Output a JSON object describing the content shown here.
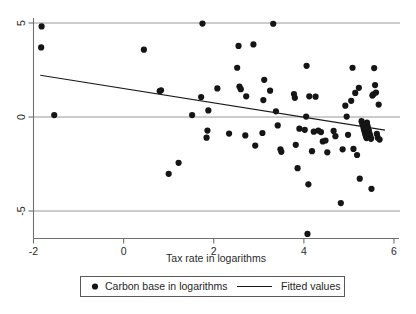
{
  "chart_data": {
    "type": "scatter",
    "title": "",
    "xlabel": "Tax rate in logarithms",
    "ylabel": "",
    "xlim": [
      -2,
      6
    ],
    "ylim": [
      -7,
      5.6
    ],
    "xticks": [
      -2,
      0,
      2,
      4,
      6
    ],
    "xticklabels": [
      "-2",
      "0",
      "2",
      "4",
      "6"
    ],
    "yticks": [
      5,
      0,
      -5
    ],
    "yticklabels": [
      "5",
      "0",
      "-5"
    ],
    "grid": "horizontal gridlines at y = 5, 0, -5",
    "legend_position": "below axis, bordered box",
    "series": [
      {
        "name": "Carbon base in logarithms",
        "marker": "filled-circle",
        "color": "#151515",
        "points": [
          [
            -1.82,
            4.82
          ],
          [
            -1.83,
            3.7
          ],
          [
            -1.54,
            0.1
          ],
          [
            0.45,
            3.58
          ],
          [
            0.8,
            1.38
          ],
          [
            0.83,
            1.42
          ],
          [
            1.0,
            -3.02
          ],
          [
            1.22,
            -2.44
          ],
          [
            1.52,
            0.1
          ],
          [
            1.72,
            1.06
          ],
          [
            1.75,
            4.97
          ],
          [
            1.88,
            0.35
          ],
          [
            1.86,
            -0.72
          ],
          [
            1.84,
            -1.1
          ],
          [
            2.08,
            1.52
          ],
          [
            2.34,
            -0.88
          ],
          [
            2.52,
            2.62
          ],
          [
            2.55,
            3.78
          ],
          [
            2.57,
            1.62
          ],
          [
            2.6,
            1.48
          ],
          [
            2.72,
            1.1
          ],
          [
            2.7,
            -0.98
          ],
          [
            2.88,
            3.86
          ],
          [
            2.92,
            -1.52
          ],
          [
            3.12,
            1.98
          ],
          [
            3.1,
            0.9
          ],
          [
            3.08,
            -0.85
          ],
          [
            3.25,
            1.4
          ],
          [
            3.32,
            4.96
          ],
          [
            3.38,
            0.3
          ],
          [
            3.42,
            -0.45
          ],
          [
            3.48,
            -1.72
          ],
          [
            3.5,
            -1.85
          ],
          [
            3.78,
            1.22
          ],
          [
            3.8,
            1.02
          ],
          [
            3.82,
            -1.48
          ],
          [
            3.86,
            -2.72
          ],
          [
            3.9,
            -0.62
          ],
          [
            4.02,
            -0.68
          ],
          [
            4.05,
            0.02
          ],
          [
            4.06,
            2.72
          ],
          [
            4.08,
            -6.22
          ],
          [
            4.1,
            -3.58
          ],
          [
            4.12,
            1.1
          ],
          [
            4.18,
            -1.82
          ],
          [
            4.22,
            -0.78
          ],
          [
            4.26,
            1.08
          ],
          [
            4.32,
            -0.72
          ],
          [
            4.38,
            -0.8
          ],
          [
            4.42,
            -1.3
          ],
          [
            4.48,
            -1.25
          ],
          [
            4.52,
            -1.88
          ],
          [
            4.66,
            -0.74
          ],
          [
            4.7,
            -1.02
          ],
          [
            4.82,
            -4.58
          ],
          [
            4.86,
            -1.72
          ],
          [
            4.92,
            0.6
          ],
          [
            4.95,
            0.02
          ],
          [
            4.98,
            -0.95
          ],
          [
            5.05,
            0.86
          ],
          [
            5.08,
            2.62
          ],
          [
            5.1,
            -1.7
          ],
          [
            5.14,
            1.28
          ],
          [
            5.18,
            -2.02
          ],
          [
            5.22,
            1.55
          ],
          [
            5.24,
            -3.28
          ],
          [
            5.28,
            -0.22
          ],
          [
            5.3,
            -0.38
          ],
          [
            5.32,
            -0.52
          ],
          [
            5.33,
            -0.62
          ],
          [
            5.34,
            -0.7
          ],
          [
            5.35,
            -0.8
          ],
          [
            5.36,
            -0.88
          ],
          [
            5.37,
            -0.96
          ],
          [
            5.38,
            -1.04
          ],
          [
            5.39,
            -1.12
          ],
          [
            5.4,
            -0.3
          ],
          [
            5.41,
            -0.46
          ],
          [
            5.42,
            -0.58
          ],
          [
            5.43,
            -0.66
          ],
          [
            5.44,
            -0.74
          ],
          [
            5.45,
            -0.84
          ],
          [
            5.46,
            -0.92
          ],
          [
            5.47,
            -1.0
          ],
          [
            5.48,
            -1.08
          ],
          [
            5.49,
            -1.16
          ],
          [
            5.5,
            -3.82
          ],
          [
            5.52,
            1.14
          ],
          [
            5.54,
            1.2
          ],
          [
            5.56,
            2.6
          ],
          [
            5.58,
            1.7
          ],
          [
            5.6,
            1.3
          ],
          [
            5.62,
            -0.9
          ],
          [
            5.64,
            -1.1
          ],
          [
            5.66,
            0.66
          ],
          [
            5.68,
            -1.2
          ]
        ]
      }
    ],
    "fit": {
      "name": "Fitted values",
      "color": "#1a1a1a",
      "x0": -1.85,
      "y0": 2.22,
      "x1": 5.8,
      "y1": -0.7,
      "slope": -0.382,
      "intercept": 1.513
    }
  },
  "axis": {
    "xlabel": "Tax rate in logarithms",
    "xtick_labels": [
      "-2",
      "0",
      "2",
      "4",
      "6"
    ],
    "ytick_labels": [
      "5",
      "0",
      "-5"
    ]
  },
  "legend": {
    "marker_label": "Carbon base in logarithms",
    "line_label": "Fitted values"
  }
}
